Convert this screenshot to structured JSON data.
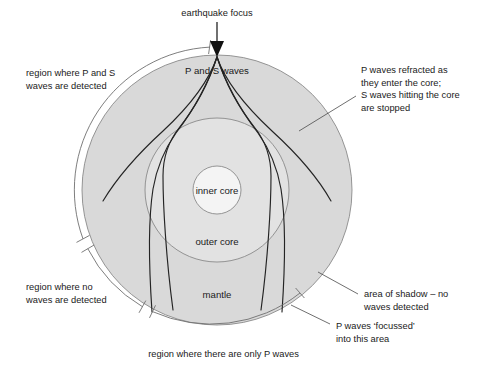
{
  "figure": {
    "title": "earthquake focus",
    "background_color": "#ffffff",
    "layers": [
      {
        "name": "mantle",
        "label": "mantle",
        "fill": "#d9d9d9",
        "stroke": "#8a8a8a"
      },
      {
        "name": "outer-core",
        "label": "outer core",
        "fill": "#e2e2e2",
        "stroke": "#8a8a8a"
      },
      {
        "name": "inner-core",
        "label": "inner core",
        "fill": "#f4f4f4",
        "stroke": "#8a8a8a"
      }
    ]
  },
  "labels": {
    "focus": "earthquake focus",
    "p_and_s_waves": "P and S waves",
    "inner_core": "inner core",
    "outer_core": "outer core",
    "mantle": "mantle"
  },
  "annotations": {
    "top_left": {
      "name": "region-ps-detected",
      "lines": [
        "region where P and S",
        "waves are detected"
      ]
    },
    "top_right": {
      "name": "p-refracted-s-stopped",
      "lines": [
        "P waves refracted as",
        "they enter the core;",
        "S waves hitting the core",
        "are stopped"
      ]
    },
    "bottom_left": {
      "name": "region-no-waves",
      "lines": [
        "region where no",
        "waves are detected"
      ]
    },
    "bottom_right": {
      "name": "shadow-zone",
      "lines": [
        "area of shadow – no",
        "waves detected"
      ]
    },
    "bottom_right_lower": {
      "name": "p-waves-focussed",
      "lines": [
        "P waves ‘focussed’",
        "into this area"
      ]
    },
    "bottom_center": {
      "name": "region-only-p-waves",
      "lines": [
        "region where there are only P waves"
      ]
    }
  },
  "colors": {
    "mantle_fill": "#d9d9d9",
    "outer_core_fill": "#e2e2e2",
    "inner_core_fill": "#f4f4f4",
    "outline_stroke": "#8a8a8a",
    "ray_stroke": "#242424",
    "bracket_stroke": "#6f6f6f",
    "text": "#1a1a1a"
  },
  "geometry": {
    "earth_center_x": 217,
    "earth_center_y": 190,
    "earth_radius": 135,
    "outer_core_radius": 72,
    "inner_core_radius": 24,
    "focus_x": 217,
    "focus_y": 56
  }
}
